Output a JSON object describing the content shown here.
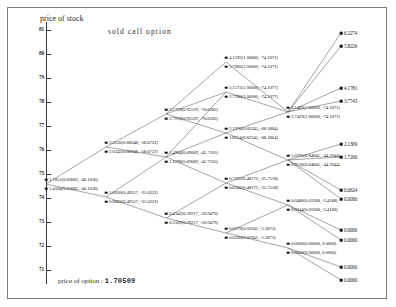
{
  "figure": {
    "axis_caption": "price of stock",
    "title": "sold call option",
    "footer_label": "price of option :",
    "footer_value": "1.70509"
  },
  "chart_data": {
    "type": "diagram",
    "title": "sold call option",
    "xlabel": "",
    "ylabel": "price of stock",
    "ylim": [
      70.6,
      81.4
    ],
    "yticks": [
      "81",
      "80",
      "79",
      "78",
      "77",
      "76",
      "75",
      "74",
      "73",
      "72",
      "71"
    ],
    "grid": false,
    "legend": "none",
    "option_price": "1.70509",
    "annotation": "Binomial replicating-portfolio tree for a sold call option. Each interior node shows two paired rows: option value (hedge ratio, bond position). Terminal nodes show the option payoff.",
    "nodes": [
      {
        "id": "n0",
        "step": 0,
        "x": 46,
        "y": 184,
        "pair": true,
        "top": "1.7051(0.63682, -46.1036)",
        "bottom": "1.4504(0.63682, -46.1036)"
      },
      {
        "id": "n1u",
        "step": 1,
        "x": 106,
        "y": 147,
        "pair": true,
        "top": "2.3556(0.80048, -58.6722)",
        "bottom": "2.0345(0.80048, -58.6722)"
      },
      {
        "id": "n1d",
        "step": 1,
        "x": 106,
        "y": 197,
        "pair": true,
        "top": "1.0030(0.49557, -35.0222)",
        "bottom": "0.8063(0.49557, -35.0222)"
      },
      {
        "id": "n2u",
        "step": 2,
        "x": 166,
        "y": 114,
        "pair": true,
        "top": "3.1759(0.95529, -70.6182)",
        "bottom": "2.7918(0.95529, -70.6182)"
      },
      {
        "id": "n2m",
        "step": 2,
        "x": 166,
        "y": 157,
        "pair": true,
        "top": "1.4904(0.69069, -45.7105)",
        "bottom": "1.2298(0.69069, -45.7105)"
      },
      {
        "id": "n2d",
        "step": 2,
        "x": 166,
        "y": 218,
        "pair": true,
        "top": "0.4342(0.29217, -20.9479)",
        "bottom": "0.3169(0.29217, -20.9479)"
      },
      {
        "id": "n3u",
        "step": 3,
        "x": 226,
        "y": 62,
        "pair": true,
        "top": "4.1593(1.00000, -74.1071)",
        "bottom": "3.7960(1.00000, -74.1071)"
      },
      {
        "id": "n3um",
        "step": 3,
        "x": 226,
        "y": 92,
        "pair": true,
        "top": "3.1573(1.00000, -74.1077)",
        "bottom": "2.7580(1.00000, -74.1077)"
      },
      {
        "id": "n3m",
        "step": 3,
        "x": 226,
        "y": 133,
        "pair": true,
        "top": "2.1976(0.82345, -68.1864)",
        "bottom": "1.8254(0.82345, -68.1864)"
      },
      {
        "id": "n3d",
        "step": 3,
        "x": 226,
        "y": 183,
        "pair": true,
        "top": "0.7333(0.48172, -35.7518)",
        "bottom": "0.6382(0.48172, -35.7518)"
      },
      {
        "id": "n3dd",
        "step": 3,
        "x": 226,
        "y": 233,
        "pair": true,
        "top": "0.0279(0.01941, -1.3873)",
        "bottom": "0.0200(0.01941, -1.3873)"
      },
      {
        "id": "n4u",
        "step": 4,
        "x": 288,
        "y": 112,
        "pair": true,
        "top": "3.1469(1.00000, -74.1071)",
        "bottom": "2.7429(1.00000, -74.1071)"
      },
      {
        "id": "n4m",
        "step": 4,
        "x": 288,
        "y": 160,
        "pair": true,
        "top": "1.0705(0.84845, -44.3944)",
        "bottom": "0.9530(0.84845, -44.3944)"
      },
      {
        "id": "n4d",
        "step": 4,
        "x": 288,
        "y": 205,
        "pair": true,
        "top": "0.0480(0.03368, -2.4168)",
        "bottom": "0.0344(0.03368, -2.4168)"
      },
      {
        "id": "n4dd",
        "step": 4,
        "x": 288,
        "y": 248,
        "pair": true,
        "top": "0.0000(0.00000, 0.0000)",
        "bottom": "0.0000(0.00000, 0.0000)"
      }
    ],
    "terminals": [
      {
        "id": "t0",
        "x": 341,
        "y": 33,
        "value": "6.2274"
      },
      {
        "id": "t1",
        "x": 341,
        "y": 46,
        "value": "5.8226"
      },
      {
        "id": "t2",
        "x": 341,
        "y": 88,
        "value": "4.1781"
      },
      {
        "id": "t3",
        "x": 341,
        "y": 101,
        "value": "3.7743"
      },
      {
        "id": "t4",
        "x": 341,
        "y": 144,
        "value": "2.1309"
      },
      {
        "id": "t5",
        "x": 341,
        "y": 157,
        "value": "1.7260"
      },
      {
        "id": "t6",
        "x": 341,
        "y": 190,
        "value": "0.0624"
      },
      {
        "id": "t7",
        "x": 341,
        "y": 199,
        "value": "0.0000"
      },
      {
        "id": "t8",
        "x": 341,
        "y": 230,
        "value": "0.0000"
      },
      {
        "id": "t9",
        "x": 341,
        "y": 240,
        "value": "0.0000"
      },
      {
        "id": "t10",
        "x": 341,
        "y": 267,
        "value": "0.0000"
      },
      {
        "id": "t11",
        "x": 341,
        "y": 280,
        "value": "0.0000"
      }
    ],
    "edges": [
      [
        46,
        184,
        106,
        147
      ],
      [
        46,
        184,
        106,
        197
      ],
      [
        106,
        147,
        166,
        114
      ],
      [
        106,
        147,
        166,
        157
      ],
      [
        106,
        197,
        166,
        157
      ],
      [
        106,
        197,
        166,
        218
      ],
      [
        166,
        114,
        226,
        62
      ],
      [
        166,
        114,
        226,
        92
      ],
      [
        166,
        114,
        226,
        133
      ],
      [
        166,
        157,
        226,
        92
      ],
      [
        166,
        157,
        226,
        133
      ],
      [
        166,
        157,
        226,
        183
      ],
      [
        166,
        218,
        226,
        183
      ],
      [
        166,
        218,
        226,
        233
      ],
      [
        226,
        62,
        288,
        112
      ],
      [
        226,
        92,
        288,
        112
      ],
      [
        226,
        133,
        288,
        112
      ],
      [
        226,
        133,
        288,
        160
      ],
      [
        226,
        183,
        288,
        160
      ],
      [
        226,
        183,
        288,
        205
      ],
      [
        226,
        233,
        288,
        205
      ],
      [
        226,
        233,
        288,
        248
      ],
      [
        288,
        112,
        341,
        33
      ],
      [
        288,
        112,
        341,
        46
      ],
      [
        288,
        112,
        341,
        88
      ],
      [
        288,
        112,
        341,
        101
      ],
      [
        288,
        160,
        341,
        144
      ],
      [
        288,
        160,
        341,
        157
      ],
      [
        288,
        160,
        341,
        190
      ],
      [
        288,
        160,
        341,
        199
      ],
      [
        288,
        205,
        341,
        230
      ],
      [
        288,
        205,
        341,
        240
      ],
      [
        288,
        248,
        341,
        267
      ],
      [
        288,
        248,
        341,
        280
      ]
    ]
  }
}
